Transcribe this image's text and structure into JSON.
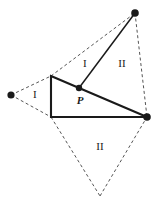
{
  "figure": {
    "background_color": "#ffffff",
    "stroke_color": "#1a1a1a",
    "dashed_color": "#555555",
    "width": 157,
    "height": 210
  },
  "vertices": [
    {
      "name": "left-vertex",
      "x": 11,
      "y": 95,
      "radius": 3.6,
      "label": ""
    },
    {
      "name": "top-vertex",
      "x": 135,
      "y": 13,
      "radius": 3.8,
      "label": ""
    },
    {
      "name": "right-vertex",
      "x": 147,
      "y": 117,
      "radius": 3.8,
      "label": ""
    },
    {
      "name": "point-p",
      "x": 79,
      "y": 88,
      "radius": 3.2,
      "label": "P"
    }
  ],
  "solid_triangle": {
    "name": "solid-triangle",
    "points": "51,76 147,117 51,117",
    "stroke_width": 2.1
  },
  "solid_segments": [
    {
      "name": "segment-p-to-top",
      "x1": 79,
      "y1": 88,
      "x2": 135,
      "y2": 13,
      "stroke_width": 1.5
    }
  ],
  "dashed_segments": [
    {
      "name": "dashed-left-to-upperleft",
      "x1": 11,
      "y1": 95,
      "x2": 51,
      "y2": 76
    },
    {
      "name": "dashed-left-to-lowerleft",
      "x1": 11,
      "y1": 95,
      "x2": 51,
      "y2": 117
    },
    {
      "name": "dashed-upperleft-to-top",
      "x1": 51,
      "y1": 76,
      "x2": 135,
      "y2": 13
    },
    {
      "name": "dashed-top-to-right",
      "x1": 135,
      "y1": 13,
      "x2": 147,
      "y2": 117
    },
    {
      "name": "dashed-lowerleft-to-bottom",
      "x1": 51,
      "y1": 117,
      "x2": 100,
      "y2": 196
    },
    {
      "name": "dashed-bottom-to-right",
      "x1": 100,
      "y1": 196,
      "x2": 147,
      "y2": 117
    }
  ],
  "region_labels": [
    {
      "name": "region-label-left-I",
      "text": "I",
      "x": 35,
      "y": 94
    },
    {
      "name": "region-label-upper-I",
      "text": "I",
      "x": 85,
      "y": 63
    },
    {
      "name": "region-label-upper-II",
      "text": "II",
      "x": 122,
      "y": 63
    },
    {
      "name": "region-label-bottom-II",
      "text": "II",
      "x": 100,
      "y": 146
    }
  ],
  "point_labels": [
    {
      "name": "point-label-P",
      "text": "P",
      "x": 80,
      "y": 100
    }
  ]
}
